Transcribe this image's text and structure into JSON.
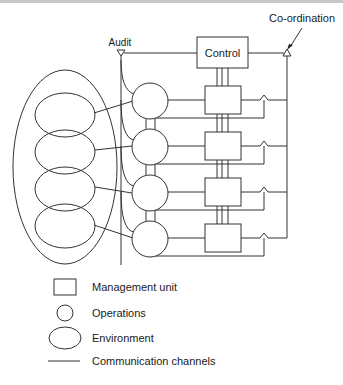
{
  "diagram": {
    "labels": {
      "audit": "Audit",
      "control": "Control",
      "coordination": "Co-ordination"
    },
    "operations_count": 4,
    "environment_count": 4,
    "legend": [
      {
        "shape": "square",
        "label": "Management unit"
      },
      {
        "shape": "circle",
        "label": "Operations"
      },
      {
        "shape": "ellipse",
        "label": "Environment"
      },
      {
        "shape": "line",
        "label": "Communication channels"
      }
    ]
  }
}
